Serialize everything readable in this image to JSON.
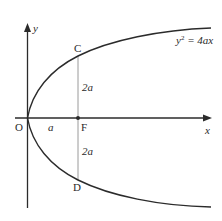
{
  "diagram": {
    "equation": {
      "lhs": "y",
      "sup": "2",
      "rhs": " = 4ax"
    },
    "axes": {
      "x_label": "x",
      "y_label": "y",
      "origin_label": "O"
    },
    "points": {
      "C": "C",
      "F": "F",
      "D": "D"
    },
    "segment_labels": {
      "OF": "a",
      "FC": "2a",
      "FD": "2a"
    },
    "colors": {
      "curve": "#2b2b2b",
      "axes": "#2b2b2b",
      "latus_rectum": "#9a9a9a",
      "background": "#ffffff"
    }
  }
}
